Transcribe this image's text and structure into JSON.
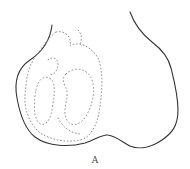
{
  "figure": {
    "label": "A",
    "outline_color": "#333333",
    "stipple_color": "#8a8a8a",
    "background": "#ffffff"
  }
}
